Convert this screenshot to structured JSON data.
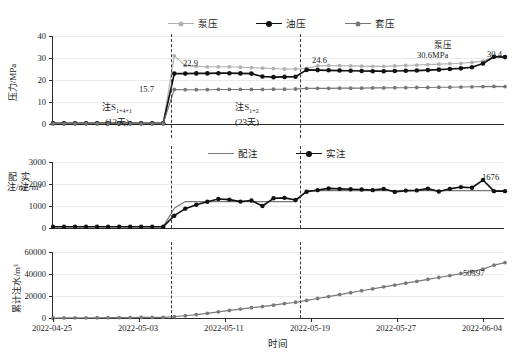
{
  "chart_data": {
    "type": "line",
    "title": "",
    "xlabel": "时间",
    "x_tick_labels": [
      "2022-04-25",
      "2022-05-03",
      "2022-05-11",
      "2022-05-19",
      "2022-05-27",
      "2022-06-04"
    ],
    "x_start": "2022-04-25",
    "x_end": "2022-06-08",
    "phase_dividers": [
      "2022-05-06",
      "2022-05-18"
    ],
    "panels": [
      {
        "id": "pressure",
        "ylabel": "压力/MPa",
        "ylim": [
          0,
          40
        ],
        "yticks": [
          0,
          10,
          20,
          30,
          40
        ],
        "legend": [
          {
            "name": "泵压",
            "color": "#b0b0b0"
          },
          {
            "name": "油压",
            "color": "#111111"
          },
          {
            "name": "套压",
            "color": "#777777"
          }
        ],
        "series": [
          {
            "name": "泵压",
            "color": "#b0b0b0",
            "values": [
              0.4,
              0.4,
              0.4,
              0.4,
              0.4,
              0.4,
              0.4,
              0.4,
              0.4,
              0.4,
              0.4,
              31.0,
              26.5,
              26.2,
              26.0,
              26.0,
              26.0,
              25.8,
              25.6,
              25.4,
              25.2,
              25.0,
              25.0,
              25.3,
              26.4,
              26.6,
              26.5,
              26.4,
              26.3,
              26.2,
              26.2,
              26.4,
              26.6,
              26.8,
              27.0,
              27.2,
              27.4,
              27.6,
              28.0,
              28.6,
              30.6,
              30.4
            ]
          },
          {
            "name": "油压",
            "color": "#111111",
            "values": [
              0.3,
              0.3,
              0.3,
              0.3,
              0.3,
              0.3,
              0.3,
              0.3,
              0.3,
              0.3,
              0.3,
              22.9,
              22.9,
              23.0,
              23.0,
              23.1,
              23.1,
              23.0,
              22.9,
              21.6,
              21.3,
              21.4,
              21.5,
              24.6,
              24.5,
              24.4,
              24.3,
              24.2,
              24.1,
              24.0,
              24.0,
              24.1,
              24.2,
              24.3,
              24.5,
              24.7,
              25.0,
              25.3,
              25.8,
              27.5,
              30.6,
              30.4
            ]
          },
          {
            "name": "套压",
            "color": "#777777",
            "values": [
              0.2,
              0.2,
              0.2,
              0.2,
              0.2,
              0.2,
              0.2,
              0.2,
              0.2,
              0.2,
              0.2,
              15.7,
              15.6,
              15.6,
              15.6,
              15.7,
              15.7,
              15.7,
              15.7,
              15.7,
              15.8,
              15.8,
              15.9,
              16.2,
              16.2,
              16.2,
              16.3,
              16.3,
              16.3,
              16.4,
              16.4,
              16.5,
              16.5,
              16.6,
              16.6,
              16.7,
              16.7,
              16.8,
              16.9,
              17.0,
              17.1,
              17.0
            ]
          }
        ],
        "annotations": [
          {
            "text": "15.7",
            "value": 15.7
          },
          {
            "text": "22.9",
            "value": 22.9
          },
          {
            "text": "24.6",
            "value": 24.6
          },
          {
            "text": "30.4",
            "value": 30.4
          },
          {
            "text": "泵压",
            "value": null
          },
          {
            "text": "30.6MPa",
            "value": 30.6
          }
        ],
        "phase_labels": [
          {
            "line1": "注S",
            "sub1": "1+4+1",
            "line2": "(12天)"
          },
          {
            "line1": "注S",
            "sub1": "1+2",
            "line2": "(23天)"
          }
        ]
      },
      {
        "id": "injection",
        "ylabel": "配注/实注 m³",
        "ylabel_parts": [
          "配注/m³",
          "实注/m³"
        ],
        "ylim": [
          0,
          3000
        ],
        "yticks": [
          0,
          1000,
          2000,
          3000
        ],
        "legend": [
          {
            "name": "配注",
            "color": "#777777"
          },
          {
            "name": "实注",
            "color": "#111111"
          }
        ],
        "series": [
          {
            "name": "配注",
            "color": "#777777",
            "values": [
              60,
              60,
              60,
              60,
              60,
              60,
              60,
              60,
              60,
              60,
              60,
              900,
              1200,
              1200,
              1200,
              1200,
              1200,
              1200,
              1200,
              1200,
              1200,
              1200,
              1200,
              1700,
              1700,
              1700,
              1700,
              1700,
              1700,
              1700,
              1700,
              1700,
              1700,
              1700,
              1700,
              1700,
              1700,
              1700,
              1700,
              1700,
              1700,
              1700
            ]
          },
          {
            "name": "实注",
            "color": "#111111",
            "values": [
              60,
              60,
              60,
              60,
              60,
              60,
              55,
              55,
              55,
              55,
              55,
              560,
              880,
              1060,
              1190,
              1320,
              1290,
              1200,
              1250,
              1000,
              1350,
              1370,
              1270,
              1650,
              1720,
              1800,
              1780,
              1760,
              1750,
              1720,
              1780,
              1640,
              1700,
              1710,
              1790,
              1660,
              1780,
              1860,
              1830,
              2180,
              1676,
              1676
            ]
          }
        ],
        "annotations": [
          {
            "text": "1676",
            "value": 1676
          }
        ]
      },
      {
        "id": "cumulative",
        "ylabel": "累计注水/m³",
        "ylim": [
          0,
          60000
        ],
        "yticks": [
          0,
          20000,
          40000,
          60000
        ],
        "legend": [],
        "series": [
          {
            "name": "累计注水",
            "color": "#7a7a7a",
            "values": [
              0,
              60,
              120,
              180,
              240,
              300,
              360,
              420,
              480,
              540,
              600,
              1160,
              2040,
              3100,
              4290,
              5610,
              6900,
              8100,
              9350,
              10350,
              11700,
              13070,
              14340,
              15990,
              17710,
              19510,
              21290,
              23050,
              24800,
              26520,
              28300,
              29940,
              31640,
              33350,
              35140,
              36800,
              38580,
              40440,
              42270,
              44450,
              48000,
              50397
            ]
          }
        ],
        "annotations": [
          {
            "text": "50397",
            "value": 50397
          }
        ]
      }
    ]
  }
}
